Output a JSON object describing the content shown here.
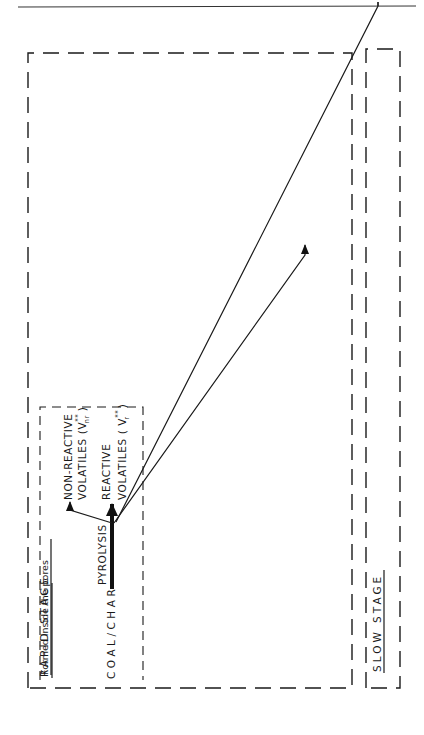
{
  "diagram": {
    "stages": {
      "rapid": "RAPID STAGE",
      "slow": "SLOW STAGE"
    },
    "source": "COAL/CHAR",
    "process": "PYROLYSIS",
    "pores_box_title": "Formed inside the pores",
    "nodes": {
      "non_reactive_volatiles": "NON-REACTIVE",
      "non_reactive_volatiles_2": "VOLATILES (V",
      "non_reactive_volatiles_sub": "nr",
      "reactive_volatiles": "REACTIVE",
      "reactive_volatiles_2": "VOLATILES ( V",
      "reactive_volatiles_sub": "r",
      "reactive_char": "REACTIVE   CHAR",
      "residual_char": "RESIDUAL   CHAR",
      "ch4_rapid": "CH",
      "ch4_slow": "CH",
      "ch4_sub": "4",
      "h2": "H",
      "h2_sub": "2"
    },
    "outputs": {
      "nr_loss_1": "NON-REACTIVE",
      "nr_loss_2": "VOLATILES  LOSS",
      "nr_loss_3": "( V",
      "nr_loss_3b": "nr",
      "nr_loss_3c": " =  V",
      "nr_loss_3d": "nr",
      "nr_loss_3e": " )",
      "total_loss_1": "REACTIVE +",
      "total_loss_2": "NON-REACTIVE",
      "total_loss_3": "VOLATILES LOSS",
      "total_loss_4a": "( V",
      "total_loss_4b": "r",
      "total_loss_4c": " < V",
      "total_loss_4d": "r",
      "total_loss_4e": " )"
    },
    "paths": {
      "escape_pores": "Escape  out  of  pores",
      "escape_unreacted": "Escape  out  unreacted",
      "escape_unreacted_rate": "( rate  coeff. : K",
      "escape_unreacted_rate_sub": "c",
      "deposition_1": "Deposition  inside  by",
      "deposition_2": "polymerization  and/or",
      "deposition_3": "cracking",
      "deposition_rate": "( rate  coeff. : k",
      "deposition_rate_sub": "1",
      "hydrogenation_1": "Escape  after  being",
      "hydrogenation_2": "non-reactive  by",
      "hydrogenation_3": "hydrogenation",
      "hydrogenation_rate": "( rate  coeff. : k",
      "hydrogenation_rate_sub": "2",
      "char_rate": "( rate  coeff. : k",
      "char_rate_sub": "3"
    },
    "marks": {
      "star": "*",
      "double_star": "**",
      "double_prime": "″",
      "close_paren": " )"
    }
  }
}
